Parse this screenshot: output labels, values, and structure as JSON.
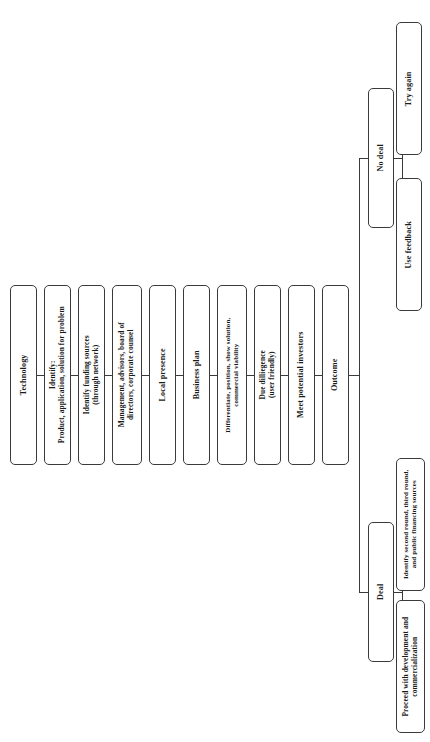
{
  "diagram": {
    "orientation": "rotated-90-ccw",
    "line_color": "#3a3a3a",
    "box_fill": "#ffffff",
    "chain": [
      {
        "id": "technology",
        "label": "Technology"
      },
      {
        "id": "identify",
        "label": "Identify:\nProduct, application, solution for problem"
      },
      {
        "id": "funding",
        "label": "Identify funding sources\n(through network)"
      },
      {
        "id": "management",
        "label": "Management, advisors, board of\ndirectors, corporate counsel"
      },
      {
        "id": "local",
        "label": "Local presence"
      },
      {
        "id": "business_plan",
        "label": "Business plan"
      },
      {
        "id": "differentiate",
        "label": "Differentiate, position, show solution,\ncommercial viability"
      },
      {
        "id": "due_diligence",
        "label": "Due dilliegence\n(user friendly)"
      },
      {
        "id": "meet",
        "label": "Meet potential investors"
      },
      {
        "id": "outcome",
        "label": "Outcome"
      }
    ],
    "branches": [
      {
        "id": "deal",
        "label": "Deal"
      },
      {
        "id": "no_deal",
        "label": "No deal"
      }
    ],
    "leaves": {
      "deal": [
        {
          "id": "proceed",
          "label": "Proceed with development and\ncommercialization"
        },
        {
          "id": "second_round",
          "label": "Identify second round, third round,\nand public financing sources"
        }
      ],
      "no_deal": [
        {
          "id": "use_feedback",
          "label": "Use feedback"
        },
        {
          "id": "try_again",
          "label": "Try again"
        }
      ]
    }
  }
}
